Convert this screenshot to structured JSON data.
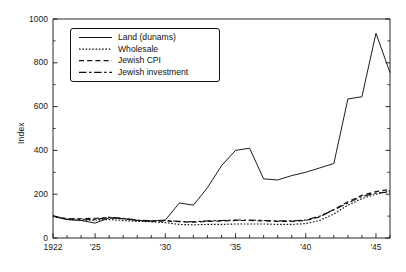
{
  "figure": {
    "title_partial": "",
    "background": "#ffffff",
    "ink_color": "#111111"
  },
  "axes": {
    "y_axis_label": "Index",
    "y_ticks": [
      "0",
      "200",
      "400",
      "600",
      "800",
      "1000"
    ],
    "x_ticks": [
      "1922",
      "'25",
      "'30",
      "'35",
      "'40",
      "'45"
    ]
  },
  "legend": {
    "entries": [
      {
        "label": "Land (dunams)",
        "style": "solid",
        "name": "legend-land"
      },
      {
        "label": "Wholesale",
        "style": "dotted",
        "name": "legend-wholesale"
      },
      {
        "label": "Jewish CPI",
        "style": "dashed",
        "name": "legend-jewish-cpi"
      },
      {
        "label": "Jewish investment",
        "style": "dashdot",
        "name": "legend-jewish-investment"
      }
    ]
  },
  "chart_data": {
    "type": "line",
    "title": "",
    "xlabel": "",
    "ylabel": "Index",
    "xlim": [
      1922,
      1946
    ],
    "ylim": [
      0,
      1000
    ],
    "grid": false,
    "legend_position": "upper-left-inside",
    "x": [
      1922,
      1923,
      1924,
      1925,
      1926,
      1927,
      1928,
      1929,
      1930,
      1931,
      1932,
      1933,
      1934,
      1935,
      1936,
      1937,
      1938,
      1939,
      1940,
      1941,
      1942,
      1943,
      1944,
      1945,
      1946
    ],
    "x_tick_labels": [
      "1922",
      "'25",
      "'30",
      "'35",
      "'40",
      "'45"
    ],
    "x_tick_values": [
      1922,
      1925,
      1930,
      1935,
      1940,
      1945
    ],
    "y_tick_values": [
      0,
      200,
      400,
      600,
      800,
      1000
    ],
    "series": [
      {
        "name": "Land (dunams)",
        "style": "solid",
        "values": [
          100,
          84,
          80,
          68,
          92,
          88,
          80,
          78,
          82,
          160,
          150,
          230,
          330,
          400,
          410,
          270,
          265,
          285,
          300,
          320,
          340,
          635,
          645,
          935,
          755
        ]
      },
      {
        "name": "Wholesale",
        "style": "dotted",
        "values": [
          100,
          85,
          80,
          82,
          84,
          80,
          76,
          74,
          70,
          62,
          60,
          62,
          62,
          64,
          64,
          64,
          62,
          62,
          66,
          80,
          110,
          150,
          180,
          200,
          215
        ]
      },
      {
        "name": "Jewish CPI",
        "style": "dashed",
        "values": [
          100,
          86,
          88,
          90,
          92,
          88,
          80,
          76,
          78,
          74,
          72,
          76,
          78,
          80,
          80,
          78,
          76,
          76,
          80,
          96,
          130,
          165,
          195,
          212,
          222
        ]
      },
      {
        "name": "Jewish investment",
        "style": "dashdot",
        "values": [
          100,
          88,
          86,
          84,
          95,
          90,
          82,
          78,
          80,
          76,
          74,
          78,
          80,
          82,
          82,
          80,
          78,
          78,
          82,
          100,
          128,
          160,
          190,
          205,
          210
        ]
      }
    ]
  }
}
